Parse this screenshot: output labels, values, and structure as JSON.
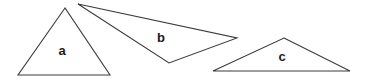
{
  "figure": {
    "background_color": "#ffffff",
    "stroke_color": "#3a3a3a",
    "label_color": "#1a1a1a",
    "width": 372,
    "height": 80,
    "shapes": [
      {
        "id": "triangle-a",
        "label": "a",
        "points": "65,8 18,75 110,75",
        "label_x": "62",
        "label_y": "52"
      },
      {
        "id": "triangle-b",
        "label": "b",
        "points": "78,4 237,38 169,63",
        "label_x": "161",
        "label_y": "39"
      },
      {
        "id": "triangle-c",
        "label": "c",
        "points": "284,38 350,71 213,71",
        "label_x": "282",
        "label_y": "58"
      }
    ]
  }
}
